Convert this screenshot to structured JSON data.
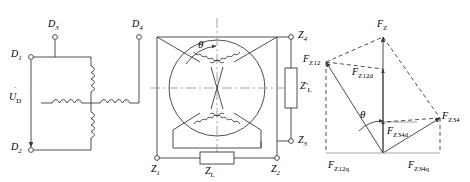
{
  "figure": {
    "type": "technical-diagram",
    "background_color": "#ffffff",
    "line_color": "#3a3a3a",
    "text_color": "#1a1a1a"
  },
  "panel_left": {
    "name": "winding-circuit-schematic",
    "terminals": [
      {
        "id": "D1",
        "label": "D",
        "sub": "1"
      },
      {
        "id": "D2",
        "label": "D",
        "sub": "2"
      },
      {
        "id": "D3",
        "label": "D",
        "sub": "3"
      },
      {
        "id": "D4",
        "label": "D",
        "sub": "4"
      }
    ],
    "source": {
      "label": "U",
      "sub": "D",
      "dot": true,
      "direction": "down"
    },
    "coil_count": 4
  },
  "panel_middle": {
    "name": "rotor-stator-cross-section",
    "angle_label": "θ",
    "terminals": [
      {
        "id": "Z1",
        "label": "Z",
        "sub": "1"
      },
      {
        "id": "Z2",
        "label": "Z",
        "sub": "2"
      },
      {
        "id": "Z3",
        "label": "Z",
        "sub": "3"
      },
      {
        "id": "Z4",
        "label": "Z",
        "sub": "4"
      }
    ],
    "impedances": [
      {
        "id": "ZL",
        "label": "Z",
        "sub": "L",
        "prime": false
      },
      {
        "id": "ZLp",
        "label": "Z",
        "sub": "L",
        "prime": true
      }
    ],
    "winding_count": 4
  },
  "panel_right": {
    "name": "mmf-phasor-diagram",
    "angle_label": "θ",
    "vectors": [
      {
        "id": "FZ",
        "label": "F",
        "sub": "Z",
        "kind": "resultant"
      },
      {
        "id": "FZ12",
        "label": "F",
        "sub": "Z12",
        "kind": "component"
      },
      {
        "id": "FZ34",
        "label": "F",
        "sub": "Z34",
        "kind": "component"
      },
      {
        "id": "FZ12d",
        "label": "F",
        "sub": "Z12d",
        "kind": "projection"
      },
      {
        "id": "FZ34d",
        "label": "F",
        "sub": "Z34d",
        "kind": "projection"
      },
      {
        "id": "FZ12q",
        "label": "F",
        "sub": "Z12q",
        "kind": "projection"
      },
      {
        "id": "FZ34q",
        "label": "F",
        "sub": "Z34q",
        "kind": "projection"
      }
    ]
  }
}
